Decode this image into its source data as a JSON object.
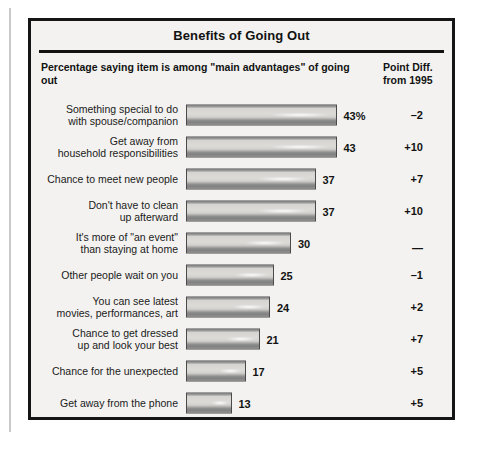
{
  "chart": {
    "title": "Benefits of Going Out",
    "subhead": "Percentage saying item is among \"main advantages\" of going out",
    "diff_header_line1": "Point Diff.",
    "diff_header_line2": "from 1995"
  },
  "chart_data": {
    "type": "bar",
    "title": "Benefits of Going Out",
    "subtitle": "Percentage saying item is among \"main advantages\" of going out",
    "xlabel": "",
    "ylabel": "",
    "xlim": [
      0,
      43
    ],
    "grid": false,
    "legend": null,
    "orientation": "horizontal",
    "categories": [
      "Something special to do with spouse/companion",
      "Get away from household responsibilities",
      "Chance to meet new people",
      "Don't have to clean up afterward",
      "It's more of \"an event\" than staying at home",
      "Other people wait on you",
      "You can see latest movies, performances, art",
      "Chance to get dressed up and look your best",
      "Chance for the unexpected",
      "Get away from the phone"
    ],
    "values": [
      43,
      43,
      37,
      37,
      30,
      25,
      24,
      21,
      17,
      13
    ],
    "value_labels": [
      "43%",
      "43",
      "37",
      "37",
      "30",
      "25",
      "24",
      "21",
      "17",
      "13"
    ],
    "annotations": {
      "column_header": "Point Diff. from 1995",
      "column_values": [
        "-2",
        "+10",
        "+7",
        "+10",
        "—",
        "-1",
        "+2",
        "+7",
        "+5",
        "+5"
      ]
    }
  },
  "rows": [
    {
      "label_line1": "Something special to do",
      "label_line2": "with spouse/companion",
      "value": 43,
      "value_label": "43%",
      "diff": "–2"
    },
    {
      "label_line1": "Get away from",
      "label_line2": "household responsibilities",
      "value": 43,
      "value_label": "43",
      "diff": "+10"
    },
    {
      "label_line1": "Chance to meet new people",
      "label_line2": "",
      "value": 37,
      "value_label": "37",
      "diff": "+7"
    },
    {
      "label_line1": "Don't have to clean",
      "label_line2": "up afterward",
      "value": 37,
      "value_label": "37",
      "diff": "+10"
    },
    {
      "label_line1": "It's more of \"an event\"",
      "label_line2": "than staying at home",
      "value": 30,
      "value_label": "30",
      "diff": "—"
    },
    {
      "label_line1": "Other people wait on you",
      "label_line2": "",
      "value": 25,
      "value_label": "25",
      "diff": "–1"
    },
    {
      "label_line1": "You can see latest",
      "label_line2": "movies, performances, art",
      "value": 24,
      "value_label": "24",
      "diff": "+2"
    },
    {
      "label_line1": "Chance to get dressed",
      "label_line2": "up and look your best",
      "value": 21,
      "value_label": "21",
      "diff": "+7"
    },
    {
      "label_line1": "Chance for the unexpected",
      "label_line2": "",
      "value": 17,
      "value_label": "17",
      "diff": "+5"
    },
    {
      "label_line1": "Get away from the phone",
      "label_line2": "",
      "value": 13,
      "value_label": "13",
      "diff": "+5"
    }
  ],
  "scale": {
    "px_per_point": 3.5,
    "max_value": 43
  }
}
